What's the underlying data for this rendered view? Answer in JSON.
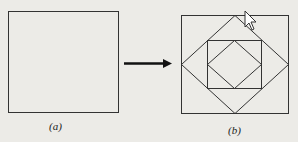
{
  "figure": {
    "panel_a": {
      "label": "(a)",
      "description": "square"
    },
    "arrow": {
      "direction": "right"
    },
    "panel_b": {
      "label": "(b)",
      "description": "square with nested inscribed diamond, square, and diamond"
    },
    "colors": {
      "background": "#ecebe7",
      "stroke": "#333333"
    }
  }
}
